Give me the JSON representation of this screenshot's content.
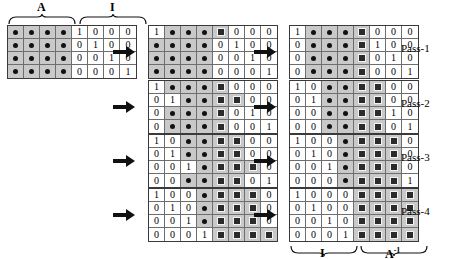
{
  "figure": {
    "cell_legend": {
      "num": "plain numeric value",
      "dot": "filled-dot cell (unknown / generic nonzero element)",
      "bx": "boxed-X cell (computed inverse element)"
    }
  },
  "top_braces": [
    {
      "label": "A",
      "name": "brace-label-A"
    },
    {
      "label": "I",
      "name": "brace-label-I"
    }
  ],
  "bottom_braces": [
    {
      "label": "I",
      "sup": "",
      "name": "brace-label-I-result"
    },
    {
      "label": "A",
      "sup": "-1",
      "name": "brace-label-A-inverse"
    }
  ],
  "initial_matrix": {
    "name": "initial-augmented-matrix",
    "rows": [
      [
        "dot:",
        "dot:",
        "dot:",
        "dot:",
        "num:1",
        "num:0",
        "num:0",
        "num:0"
      ],
      [
        "dot:",
        "dot:",
        "dot:",
        "dot:",
        "num:0",
        "num:1",
        "num:0",
        "num:0"
      ],
      [
        "dot:",
        "dot:",
        "dot:",
        "dot:",
        "num:0",
        "num:0",
        "num:1",
        "num:0"
      ],
      [
        "dot:",
        "dot:",
        "dot:",
        "dot:",
        "num:0",
        "num:0",
        "num:0",
        "num:1"
      ]
    ]
  },
  "passes": [
    {
      "label": "Pass-1",
      "middle": {
        "name": "pass-1-middle-matrix",
        "rows": [
          [
            "num:1",
            "dot:",
            "dot:",
            "dot:",
            "bx:",
            "num:0",
            "num:0",
            "num:0"
          ],
          [
            "dot:",
            "dot:",
            "dot:",
            "dot:",
            "num:0",
            "num:1",
            "num:0",
            "num:0"
          ],
          [
            "dot:",
            "dot:",
            "dot:",
            "dot:",
            "num:0",
            "num:0",
            "num:1",
            "num:0"
          ],
          [
            "dot:",
            "dot:",
            "dot:",
            "dot:",
            "num:0",
            "num:0",
            "num:0",
            "num:1"
          ]
        ]
      },
      "right": {
        "name": "pass-1-right-matrix",
        "rows": [
          [
            "num:1",
            "dot:",
            "dot:",
            "dot:",
            "bx:",
            "num:0",
            "num:0",
            "num:0"
          ],
          [
            "num:0",
            "dot:",
            "dot:",
            "dot:",
            "bx:",
            "num:1",
            "num:0",
            "num:0"
          ],
          [
            "num:0",
            "dot:",
            "dot:",
            "dot:",
            "bx:",
            "num:0",
            "num:1",
            "num:0"
          ],
          [
            "num:0",
            "dot:",
            "dot:",
            "dot:",
            "bx:",
            "num:0",
            "num:0",
            "num:1"
          ]
        ]
      }
    },
    {
      "label": "Pass-2",
      "middle": {
        "name": "pass-2-middle-matrix",
        "rows": [
          [
            "num:1",
            "dot:",
            "dot:",
            "dot:",
            "bx:",
            "num:0",
            "num:0",
            "num:0"
          ],
          [
            "num:0",
            "num:1",
            "dot:",
            "dot:",
            "bx:",
            "bx:",
            "num:0",
            "num:0"
          ],
          [
            "num:0",
            "dot:",
            "dot:",
            "dot:",
            "bx:",
            "num:0",
            "num:1",
            "num:0"
          ],
          [
            "num:0",
            "dot:",
            "dot:",
            "dot:",
            "bx:",
            "num:0",
            "num:0",
            "num:1"
          ]
        ]
      },
      "right": {
        "name": "pass-2-right-matrix",
        "rows": [
          [
            "num:1",
            "num:0",
            "dot:",
            "dot:",
            "bx:",
            "bx:",
            "num:0",
            "num:0"
          ],
          [
            "num:0",
            "num:1",
            "dot:",
            "dot:",
            "bx:",
            "bx:",
            "num:0",
            "num:0"
          ],
          [
            "num:0",
            "num:0",
            "dot:",
            "dot:",
            "bx:",
            "bx:",
            "num:1",
            "num:0"
          ],
          [
            "num:0",
            "num:0",
            "dot:",
            "dot:",
            "bx:",
            "bx:",
            "num:0",
            "num:1"
          ]
        ]
      }
    },
    {
      "label": "Pass-3",
      "middle": {
        "name": "pass-3-middle-matrix",
        "rows": [
          [
            "num:1",
            "num:0",
            "dot:",
            "dot:",
            "bx:",
            "bx:",
            "num:0",
            "num:0"
          ],
          [
            "num:0",
            "num:1",
            "dot:",
            "dot:",
            "bx:",
            "bx:",
            "num:0",
            "num:0"
          ],
          [
            "num:0",
            "num:0",
            "num:1",
            "dot:",
            "bx:",
            "bx:",
            "bx:",
            "num:0"
          ],
          [
            "num:0",
            "num:0",
            "dot:",
            "dot:",
            "bx:",
            "bx:",
            "num:0",
            "num:1"
          ]
        ]
      },
      "right": {
        "name": "pass-3-right-matrix",
        "rows": [
          [
            "num:1",
            "num:0",
            "num:0",
            "dot:",
            "bx:",
            "bx:",
            "bx:",
            "num:0"
          ],
          [
            "num:0",
            "num:1",
            "num:0",
            "dot:",
            "bx:",
            "bx:",
            "bx:",
            "num:0"
          ],
          [
            "num:0",
            "num:0",
            "num:1",
            "dot:",
            "bx:",
            "bx:",
            "bx:",
            "num:0"
          ],
          [
            "num:0",
            "num:0",
            "num:0",
            "dot:",
            "bx:",
            "bx:",
            "bx:",
            "num:1"
          ]
        ]
      }
    },
    {
      "label": "Pass-4",
      "middle": {
        "name": "pass-4-middle-matrix",
        "rows": [
          [
            "num:1",
            "num:0",
            "num:0",
            "dot:",
            "bx:",
            "bx:",
            "bx:",
            "num:0"
          ],
          [
            "num:0",
            "num:1",
            "num:0",
            "dot:",
            "bx:",
            "bx:",
            "bx:",
            "num:0"
          ],
          [
            "num:0",
            "num:0",
            "num:1",
            "dot:",
            "bx:",
            "bx:",
            "bx:",
            "num:0"
          ],
          [
            "num:0",
            "num:0",
            "num:0",
            "num:1",
            "bx:",
            "bx:",
            "bx:",
            "bx:"
          ]
        ]
      },
      "right": {
        "name": "pass-4-right-matrix",
        "rows": [
          [
            "num:1",
            "num:0",
            "num:0",
            "num:0",
            "bx:",
            "bx:",
            "bx:",
            "bx:"
          ],
          [
            "num:0",
            "num:1",
            "num:0",
            "num:0",
            "bx:",
            "bx:",
            "bx:",
            "bx:"
          ],
          [
            "num:0",
            "num:0",
            "num:1",
            "num:0",
            "bx:",
            "bx:",
            "bx:",
            "bx:"
          ],
          [
            "num:0",
            "num:0",
            "num:0",
            "num:1",
            "bx:",
            "bx:",
            "bx:",
            "bx:"
          ]
        ]
      }
    }
  ]
}
